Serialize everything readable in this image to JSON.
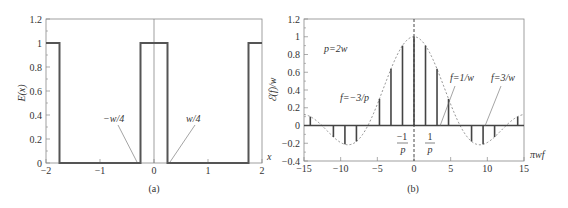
{
  "chart_data": [
    {
      "id": "a",
      "type": "line",
      "caption": "(a)",
      "title": "",
      "xlabel": "x",
      "ylabel": "E(x)",
      "xlim": [
        -2,
        2
      ],
      "ylim": [
        0,
        1.2
      ],
      "xticks": [
        -2,
        -1,
        0,
        1,
        2
      ],
      "xtick_labels": [
        "−2",
        "−1",
        "0",
        "1",
        "2"
      ],
      "yticks": [
        0,
        0.2,
        0.4,
        0.6,
        0.8,
        1,
        1.2
      ],
      "ytick_labels": [
        "0",
        "0.2",
        "0.4",
        "0.6",
        "0.8",
        "1",
        "1.2"
      ],
      "grid": false,
      "series": [
        {
          "name": "E(x) square wave",
          "x": [
            -2,
            -1.75,
            -1.75,
            -0.25,
            -0.25,
            0.25,
            0.25,
            1.75,
            1.75,
            2
          ],
          "y": [
            1,
            1,
            0,
            0,
            1,
            1,
            0,
            0,
            1,
            1
          ]
        }
      ],
      "annotations": [
        {
          "text": "−w/4",
          "x": -0.25,
          "y": 0
        },
        {
          "text": "w/4",
          "x": 0.25,
          "y": 0
        }
      ]
    },
    {
      "id": "b",
      "type": "stem",
      "caption": "(b)",
      "title": "",
      "xlabel": "πwf",
      "ylabel": "ℰ(f)/w",
      "xlim": [
        -15,
        15
      ],
      "ylim": [
        -0.4,
        1.2
      ],
      "xticks": [
        -15,
        -10,
        -5,
        0,
        5,
        10,
        15
      ],
      "xtick_labels": [
        "−15",
        "−10",
        "−5",
        "0",
        "5",
        "10",
        "15"
      ],
      "yticks": [
        -0.4,
        -0.2,
        0,
        0.2,
        0.4,
        0.6,
        0.8,
        1,
        1.2
      ],
      "ytick_labels": [
        "−0.4",
        "−0.2",
        "0",
        "0.2",
        "0.4",
        "0.6",
        "0.8",
        "1",
        "1.2"
      ],
      "grid": false,
      "series": [
        {
          "name": "stems",
          "x": [
            -14.14,
            -12.57,
            -10.99,
            -9.42,
            -7.85,
            -6.28,
            -4.71,
            -3.14,
            -1.57,
            0,
            1.57,
            3.14,
            4.71,
            6.28,
            7.85,
            9.42,
            10.99,
            12.57,
            14.14
          ],
          "y": [
            0.1,
            0,
            -0.13,
            -0.21,
            -0.18,
            0,
            0.3,
            0.64,
            0.9,
            1.0,
            0.9,
            0.64,
            0.3,
            0,
            -0.18,
            -0.21,
            -0.13,
            0,
            0.1
          ]
        },
        {
          "name": "envelope (dashed)",
          "formula": "sin(x/2)/(x/2)"
        }
      ],
      "annotations": [
        {
          "text": "p=2w"
        },
        {
          "text": "f=−3/p"
        },
        {
          "text": "f=1/w"
        },
        {
          "text": "f=3/w"
        },
        {
          "text": "−1/p"
        },
        {
          "text": "1/p"
        }
      ]
    }
  ],
  "labels": {
    "a": {
      "caption": "(a)",
      "ylabel": "E(x)",
      "xlabel": "x",
      "neg_w4": "−w/4",
      "pos_w4": "w/4"
    },
    "b": {
      "caption": "(b)",
      "ylabel": "ℰ(f)/w",
      "xlabel": "πwf",
      "p_eq": "p=2w",
      "f_neg3p": "f=−3/p",
      "f_1w": "f=1/w",
      "f_3w": "f=3/w",
      "neg_one": "−1",
      "one": "1",
      "p_den": "p"
    }
  }
}
